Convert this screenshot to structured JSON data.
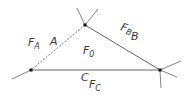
{
  "diagram": {
    "type": "triangle-with-faces",
    "colors": {
      "line": "#555555",
      "vertex": "#111111",
      "text": "#3a3a3a",
      "background": "#ffffff"
    },
    "vertices": [
      {
        "id": "top",
        "x": 85,
        "y": 25
      },
      {
        "id": "left",
        "x": 31,
        "y": 70
      },
      {
        "id": "right",
        "x": 160,
        "y": 70
      }
    ],
    "edges": [
      {
        "id": "A",
        "style": "dashed"
      },
      {
        "id": "B",
        "style": "solid"
      },
      {
        "id": "C",
        "style": "solid"
      }
    ],
    "labels": {
      "face_a_main": "F",
      "face_a_sub": "A",
      "edge_a": "A",
      "face_0_main": "F",
      "face_0_sub": "0",
      "face_b_main": "F",
      "face_b_sub": "B",
      "edge_b": "B",
      "edge_c": "C",
      "face_c_main": "F",
      "face_c_sub": "C"
    }
  }
}
